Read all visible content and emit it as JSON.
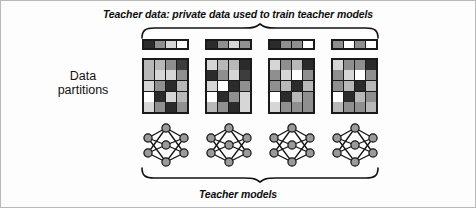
{
  "figure": {
    "top_caption": "Teacher data: private data used to train teacher models",
    "bottom_caption": "Teacher models",
    "side_label_line1": "Data",
    "side_label_line2": "partitions",
    "border_color": "#b9b9b9",
    "background_color": "#fdfdfd",
    "ink_color": "#1a1a1a"
  },
  "palette": {
    "black": "#2b2b2b",
    "dark": "#3d3d3d",
    "mid_dark": "#6e6e6e",
    "mid": "#8f8f8f",
    "light": "#b8b8b8",
    "lighter": "#d6d6d6",
    "white": "#ffffff"
  },
  "partitions": [
    {
      "name": "partition-1",
      "strip": [
        "#2b2b2b",
        "#8f8f8f",
        "#d6d6d6",
        "#ffffff"
      ],
      "grid": [
        [
          "#b8b8b8",
          "#b8b8b8",
          "#8f8f8f",
          "#3d3d3d"
        ],
        [
          "#b8b8b8",
          "#d6d6d6",
          "#d6d6d6",
          "#8f8f8f"
        ],
        [
          "#d6d6d6",
          "#8f8f8f",
          "#2b2b2b",
          "#b8b8b8"
        ],
        [
          "#ffffff",
          "#2b2b2b",
          "#d6d6d6",
          "#b8b8b8"
        ],
        [
          "#d6d6d6",
          "#8f8f8f",
          "#2b2b2b",
          "#8f8f8f"
        ]
      ],
      "network": "teacher-model-1"
    },
    {
      "name": "partition-2",
      "strip": [
        "#2b2b2b",
        "#8f8f8f",
        "#d6d6d6",
        "#8f8f8f"
      ],
      "grid": [
        [
          "#d6d6d6",
          "#b8b8b8",
          "#b8b8b8",
          "#2b2b2b"
        ],
        [
          "#2b2b2b",
          "#8f8f8f",
          "#d6d6d6",
          "#3d3d3d"
        ],
        [
          "#d6d6d6",
          "#ffffff",
          "#2b2b2b",
          "#8f8f8f"
        ],
        [
          "#ffffff",
          "#2b2b2b",
          "#8f8f8f",
          "#d6d6d6"
        ],
        [
          "#b8b8b8",
          "#8f8f8f",
          "#2b2b2b",
          "#d6d6d6"
        ]
      ],
      "network": "teacher-model-2"
    },
    {
      "name": "partition-3",
      "strip": [
        "#2b2b2b",
        "#8f8f8f",
        "#8f8f8f",
        "#ffffff"
      ],
      "grid": [
        [
          "#d6d6d6",
          "#8f8f8f",
          "#b8b8b8",
          "#2b2b2b"
        ],
        [
          "#8f8f8f",
          "#d6d6d6",
          "#ffffff",
          "#8f8f8f"
        ],
        [
          "#8f8f8f",
          "#b8b8b8",
          "#2b2b2b",
          "#b8b8b8"
        ],
        [
          "#ffffff",
          "#2b2b2b",
          "#b8b8b8",
          "#8f8f8f"
        ],
        [
          "#d6d6d6",
          "#8f8f8f",
          "#8f8f8f",
          "#8f8f8f"
        ]
      ],
      "network": "teacher-model-3"
    },
    {
      "name": "partition-4",
      "strip": [
        "#8f8f8f",
        "#ffffff",
        "#8f8f8f",
        "#ffffff"
      ],
      "grid": [
        [
          "#d6d6d6",
          "#8f8f8f",
          "#8f8f8f",
          "#2b2b2b"
        ],
        [
          "#8f8f8f",
          "#d6d6d6",
          "#ffffff",
          "#8f8f8f"
        ],
        [
          "#8f8f8f",
          "#b8b8b8",
          "#2b2b2b",
          "#b8b8b8"
        ],
        [
          "#ffffff",
          "#2b2b2b",
          "#b8b8b8",
          "#8f8f8f"
        ],
        [
          "#b8b8b8",
          "#8f8f8f",
          "#8f8f8f",
          "#b8b8b8"
        ]
      ],
      "network": "teacher-model-4"
    }
  ],
  "network_spec": {
    "node_fill": "#9a9a9a",
    "node_stroke": "#111111",
    "edge_color": "#111111",
    "layers": [
      {
        "name": "input",
        "count": 2
      },
      {
        "name": "hidden",
        "count": 3
      },
      {
        "name": "output",
        "count": 2
      }
    ]
  }
}
